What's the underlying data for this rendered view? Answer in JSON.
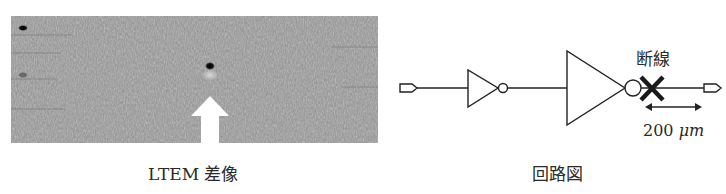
{
  "left_panel": {
    "image_kind": "LTEM difference image (grayscale)",
    "caption": "LTEM 差像",
    "marker": "arrow-up-icon",
    "defect_spot": "dark-spot"
  },
  "right_panel": {
    "caption": "回路図",
    "break_label": "断線",
    "length_value": "200 ",
    "length_unit": "μm",
    "elements": [
      "input-port",
      "small-inverter",
      "large-inverter",
      "break-mark",
      "output-port"
    ]
  },
  "colors": {
    "image_gray": "#8d8d8d",
    "line": "#222222",
    "arrow": "#ffffff"
  }
}
